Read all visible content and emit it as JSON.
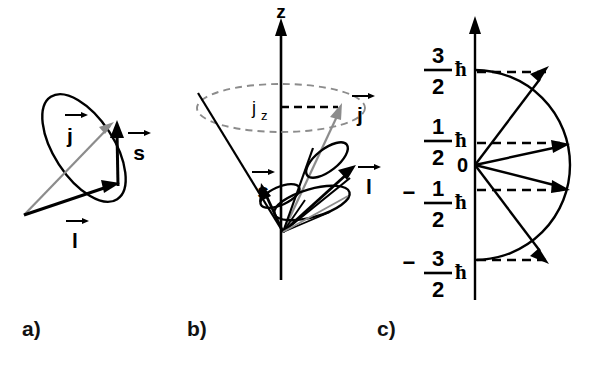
{
  "figure": {
    "title_alt": "Vector model of angular momentum coupling",
    "background_color": "#ffffff",
    "ink_color": "#000000",
    "accent_gray": "#8c8c8c"
  },
  "panels": [
    {
      "id": "a",
      "label": "a)",
      "label_x": 22,
      "label_y": 336,
      "description": "Vector sum of orbital and spin angular momentum with precession ellipse",
      "vectors": [
        {
          "name": "l-vector",
          "label": "l",
          "arrow_label": "→",
          "color": "#000000"
        },
        {
          "name": "s-vector",
          "label": "s",
          "arrow_label": "→",
          "color": "#000000"
        },
        {
          "name": "j-vector",
          "label": "j",
          "arrow_label": "→",
          "color": "#8c8c8c"
        }
      ]
    },
    {
      "id": "b",
      "label": "b)",
      "label_x": 187,
      "label_y": 336,
      "description": "Precession cones about the z axis",
      "axis_label": "z",
      "projection_label": "j",
      "projection_sub": "z",
      "vectors": [
        {
          "name": "s-vector",
          "label": "s",
          "arrow_label": "→",
          "color": "#000000"
        },
        {
          "name": "l-vector",
          "label": "l",
          "arrow_label": "→",
          "color": "#000000"
        },
        {
          "name": "j-vector",
          "label": "j",
          "arrow_label": "→",
          "color": "#8c8c8c"
        }
      ]
    },
    {
      "id": "c",
      "label": "c)",
      "label_x": 377,
      "label_y": 336,
      "description": "Allowed z-projections of j on a semicircle",
      "origin_label": "0",
      "levels": [
        {
          "name": "level-plus-three-halves",
          "sign": "",
          "numerator": "3",
          "denominator": "2",
          "unit": "ħ",
          "value": 1.5,
          "y": 72
        },
        {
          "name": "level-plus-one-half",
          "sign": "",
          "numerator": "1",
          "denominator": "2",
          "unit": "ħ",
          "value": 0.5,
          "y": 143
        },
        {
          "name": "level-minus-one-half",
          "sign": "−",
          "numerator": "1",
          "denominator": "2",
          "unit": "ħ",
          "value": -0.5,
          "y": 190
        },
        {
          "name": "level-minus-three-halves",
          "sign": "−",
          "numerator": "3",
          "denominator": "2",
          "unit": "ħ",
          "value": -1.5,
          "y": 260
        }
      ]
    }
  ]
}
